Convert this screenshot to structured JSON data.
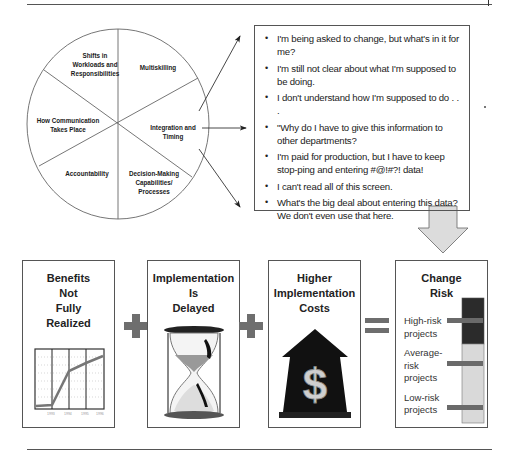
{
  "wheel": {
    "segments": [
      {
        "label": "Shifts in Workloads and Responsibilities",
        "lines": [
          "Shifts in",
          "Workloads and",
          "Responsibilities"
        ]
      },
      {
        "label": "Multiskilling",
        "lines": [
          "Multiskilling"
        ]
      },
      {
        "label": "Integration and Timing",
        "lines": [
          "Integration and",
          "Timing"
        ]
      },
      {
        "label": "Decision-Making Capabilities/ Processes",
        "lines": [
          "Decision-Making",
          "Capabilities/",
          "Processes"
        ]
      },
      {
        "label": "Accountability",
        "lines": [
          "Accountability"
        ]
      },
      {
        "label": "How Communication Takes Place",
        "lines": [
          "How Communication",
          "Takes Place"
        ]
      }
    ]
  },
  "quotes": {
    "items": [
      "I'm being asked to change, but what's in it for me?",
      "I'm still not clear about what I'm supposed to be doing.",
      "I don't understand how I'm supposed to do . . .",
      "\"Why do I have to give this information to other departments?",
      "I'm paid for production, but I have to keep stop-ping and entering #@!#?! data!",
      "I can't read all of this screen.",
      "What's the big deal about entering this data? We don't even use that here."
    ]
  },
  "equation": {
    "boxes": [
      {
        "title_lines": [
          "Benefits",
          "Not",
          "Fully",
          "Realized"
        ],
        "icon": "line-chart-icon",
        "chart": {
          "x_ticks": [
            "1993",
            "1994",
            "1995",
            "1996"
          ]
        }
      },
      {
        "title_lines": [
          "Implementation",
          "Is",
          "Delayed"
        ],
        "icon": "hourglass-icon"
      },
      {
        "title_lines": [
          "Higher",
          "Implementation",
          "Costs"
        ],
        "icon": "dollar-up-arrow-icon"
      },
      {
        "title_lines": [
          "Change",
          "Risk"
        ],
        "icon": "risk-meter-icon",
        "risk_levels": [
          "High-risk projects",
          "Average-risk projects",
          "Low-risk projects"
        ],
        "risk_level_lines": [
          [
            "High-risk",
            "projects"
          ],
          [
            "Average-",
            "risk",
            "projects"
          ],
          [
            "Low-risk",
            "projects"
          ]
        ]
      }
    ],
    "operators": [
      "+",
      "+",
      "="
    ]
  },
  "colors": {
    "line": "#555555",
    "operator": "#6e6e6e",
    "high_risk": "#2b2b2b",
    "low_risk": "#d9d9d9",
    "down_arrow_fill": "#dcdcdc",
    "cost_arrow": "#111111"
  }
}
